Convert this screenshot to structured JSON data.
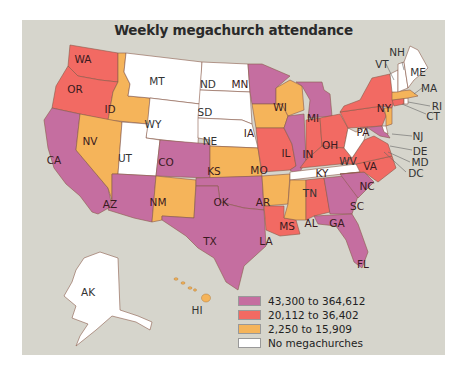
{
  "title": "Weekly megachurch attendance",
  "colors": {
    "background": "#d6d5cc",
    "high": "#c56ea0",
    "mid": "#f26a63",
    "low": "#f5b45a",
    "none": "#ffffff",
    "border": "#8a5a4a"
  },
  "legend": [
    {
      "label": "43,300 to 364,612",
      "color": "#c56ea0"
    },
    {
      "label": "20,112 to 36,402",
      "color": "#f26a63"
    },
    {
      "label": "2,250 to 15,909",
      "color": "#f5b45a"
    },
    {
      "label": "No megachurches",
      "color": "#ffffff"
    }
  ],
  "states": {
    "WA": {
      "label": "WA",
      "class": "mid"
    },
    "OR": {
      "label": "OR",
      "class": "mid"
    },
    "CA": {
      "label": "CA",
      "class": "high"
    },
    "ID": {
      "label": "ID",
      "class": "low"
    },
    "NV": {
      "label": "NV",
      "class": "low"
    },
    "MT": {
      "label": "MT",
      "class": "none"
    },
    "WY": {
      "label": "WY",
      "class": "none"
    },
    "UT": {
      "label": "UT",
      "class": "none"
    },
    "AZ": {
      "label": "AZ",
      "class": "high"
    },
    "CO": {
      "label": "CO",
      "class": "high"
    },
    "NM": {
      "label": "NM",
      "class": "low"
    },
    "ND": {
      "label": "ND",
      "class": "none"
    },
    "SD": {
      "label": "SD",
      "class": "none"
    },
    "NE": {
      "label": "NE",
      "class": "none"
    },
    "KS": {
      "label": "KS",
      "class": "low"
    },
    "OK": {
      "label": "OK",
      "class": "high"
    },
    "TX": {
      "label": "TX",
      "class": "high"
    },
    "MN": {
      "label": "MN",
      "class": "high"
    },
    "IA": {
      "label": "IA",
      "class": "low"
    },
    "MO": {
      "label": "MO",
      "class": "mid"
    },
    "AR": {
      "label": "AR",
      "class": "low"
    },
    "LA": {
      "label": "LA",
      "class": "mid"
    },
    "WI": {
      "label": "WI",
      "class": "low"
    },
    "IL": {
      "label": "IL",
      "class": "high"
    },
    "MI": {
      "label": "MI",
      "class": "high"
    },
    "IN": {
      "label": "IN",
      "class": "mid"
    },
    "OH": {
      "label": "OH",
      "class": "mid"
    },
    "KY": {
      "label": "KY",
      "class": "mid"
    },
    "TN": {
      "label": "TN",
      "class": "none"
    },
    "MS": {
      "label": "MS",
      "class": "low"
    },
    "AL": {
      "label": "AL",
      "class": "mid"
    },
    "GA": {
      "label": "GA",
      "class": "high"
    },
    "FL": {
      "label": "FL",
      "class": "high"
    },
    "SC": {
      "label": "SC",
      "class": "high"
    },
    "NC": {
      "label": "NC",
      "class": "mid"
    },
    "VA": {
      "label": "VA",
      "class": "mid"
    },
    "WV": {
      "label": "WV",
      "class": "none"
    },
    "PA": {
      "label": "PA",
      "class": "mid"
    },
    "NY": {
      "label": "NY",
      "class": "mid"
    },
    "VT": {
      "label": "VT",
      "class": "none"
    },
    "NH": {
      "label": "NH",
      "class": "none"
    },
    "ME": {
      "label": "ME",
      "class": "none"
    },
    "MA": {
      "label": "MA",
      "class": "low"
    },
    "RI": {
      "label": "RI",
      "class": "none"
    },
    "CT": {
      "label": "CT",
      "class": "mid"
    },
    "NJ": {
      "label": "NJ",
      "class": "low"
    },
    "DE": {
      "label": "DE",
      "class": "none"
    },
    "MD": {
      "label": "MD",
      "class": "high"
    },
    "DC": {
      "label": "DC",
      "class": "none"
    },
    "AK": {
      "label": "AK",
      "class": "none"
    },
    "HI": {
      "label": "HI",
      "class": "low"
    }
  }
}
